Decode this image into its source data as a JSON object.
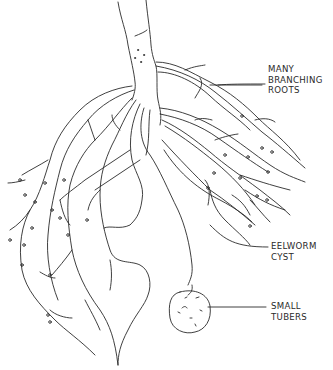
{
  "diagram": {
    "labels": [
      {
        "id": "many-branching-roots",
        "lines": [
          "MANY",
          "BRANCHING",
          "ROOTS"
        ]
      },
      {
        "id": "eelworm-cyst",
        "lines": [
          "EELWORM",
          "CYST"
        ]
      },
      {
        "id": "small-tubers",
        "lines": [
          "SMALL",
          "TUBERS"
        ]
      }
    ],
    "colors": {
      "ink": "#2a2a2a",
      "background": "#ffffff"
    }
  }
}
